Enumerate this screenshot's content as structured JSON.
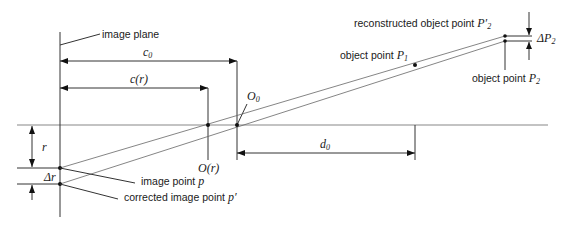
{
  "diagram": {
    "type": "camera-model-distortion-geometry",
    "labels": {
      "image_plane": "image plane",
      "c0": "c",
      "c0_sub": "0",
      "cr": "c(r)",
      "O0": "O",
      "O0_sub": "0",
      "Or": "O(r)",
      "d0": "d",
      "d0_sub": "0",
      "r": "r",
      "delta_r": "Δr",
      "image_point_p": "image point ",
      "image_point_p_sym": "p",
      "corrected_image_point": "corrected image point ",
      "corrected_image_point_sym": "p′",
      "object_point_P1": "object point ",
      "object_point_P1_sym": "P",
      "object_point_P1_sub": "1",
      "reconstructed_object_point": "reconstructed object point ",
      "reconstructed_object_point_sym": "P′",
      "reconstructed_object_point_sub": "2",
      "object_point_P2": "object point ",
      "object_point_P2_sym": "P",
      "object_point_P2_sub": "2",
      "delta_P2": "ΔP",
      "delta_P2_sub": "2"
    },
    "colors": {
      "line": "#333333",
      "ray": "#666666",
      "text": "#1a1a1a",
      "background": "#ffffff"
    }
  }
}
